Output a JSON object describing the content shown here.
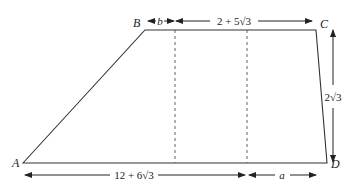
{
  "diagram": {
    "type": "trapezoid",
    "vertices": [
      {
        "label": "A",
        "x": 23,
        "y": 163
      },
      {
        "label": "B",
        "x": 145,
        "y": 30
      },
      {
        "label": "C",
        "x": 316,
        "y": 30
      },
      {
        "label": "D",
        "x": 327,
        "y": 163
      }
    ],
    "dimensions": {
      "top_left": "b",
      "top_right": "2 + 5√3",
      "bottom_left": "12 + 6√3",
      "bottom_right": "a",
      "height": "2√3"
    },
    "colors": {
      "stroke": "#333333",
      "background": "#ffffff"
    }
  }
}
